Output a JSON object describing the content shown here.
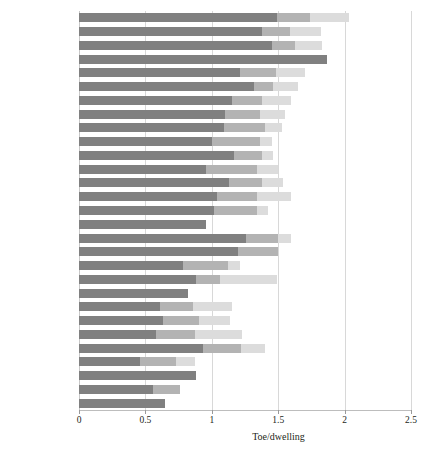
{
  "chart_data": {
    "type": "bar",
    "orientation": "horizontal",
    "stacked": true,
    "title": "",
    "subtitle": "",
    "xlabel": "Toe/dwelling",
    "ylabel": "",
    "xlim": [
      0,
      2.5
    ],
    "xticks": [
      0,
      0.5,
      1,
      1.5,
      2,
      2.5
    ],
    "xticklabels": [
      "0",
      "0.5",
      "1",
      "1.5",
      "2",
      "2.5"
    ],
    "grid": "vertical",
    "legend": "none",
    "categories": [
      "Finland",
      "Ireland",
      "Belgium",
      "Norway",
      "Austria",
      "Latvia",
      "Denmark",
      "Germany",
      "Sweden",
      "Estonia",
      "France",
      "United Kingdom",
      "Czech Republic",
      "Netherlands",
      "EU-27",
      "Slovenia",
      "Hungary",
      "Poland",
      "Greece",
      "Slovakia",
      "Italy",
      "Romania",
      "Croatia",
      "Cyprus",
      "Lithuania",
      "Spain",
      "Portugal",
      "Bulgaria",
      "Malta"
    ],
    "series": [
      {
        "name": "segment-1",
        "color": "#808080",
        "values": [
          1.49,
          1.38,
          1.45,
          1.87,
          1.21,
          1.32,
          1.15,
          1.1,
          1.09,
          1.0,
          1.17,
          0.96,
          1.13,
          1.04,
          1.02,
          0.96,
          1.26,
          1.2,
          0.78,
          0.88,
          0.82,
          0.61,
          0.63,
          0.58,
          0.93,
          0.46,
          0.88,
          0.56,
          0.65
        ]
      },
      {
        "name": "segment-2",
        "color": "#b3b3b3",
        "values": [
          0.25,
          0.21,
          0.18,
          0.0,
          0.27,
          0.14,
          0.23,
          0.26,
          0.31,
          0.36,
          0.21,
          0.38,
          0.25,
          0.3,
          0.32,
          0.0,
          0.24,
          0.3,
          0.34,
          0.18,
          0.0,
          0.25,
          0.27,
          0.29,
          0.29,
          0.27,
          0.0,
          0.2,
          0.0
        ]
      },
      {
        "name": "segment-3",
        "color": "#dcdcdc",
        "values": [
          0.29,
          0.23,
          0.2,
          0.0,
          0.22,
          0.19,
          0.22,
          0.19,
          0.13,
          0.09,
          0.08,
          0.16,
          0.16,
          0.26,
          0.08,
          0.0,
          0.1,
          0.0,
          0.09,
          0.43,
          0.0,
          0.29,
          0.24,
          0.36,
          0.18,
          0.14,
          0.0,
          0.0,
          0.0
        ]
      }
    ],
    "totals": [
      2.03,
      1.82,
      1.83,
      1.87,
      1.7,
      1.65,
      1.6,
      1.55,
      1.53,
      1.45,
      1.46,
      1.5,
      1.54,
      1.6,
      1.42,
      0.96,
      1.6,
      1.5,
      1.21,
      1.49,
      0.82,
      1.15,
      1.14,
      1.23,
      1.4,
      0.87,
      0.88,
      0.76,
      0.65
    ]
  },
  "axis": {
    "x_label": "Toe/dwelling",
    "ticks": [
      "0",
      "0.5",
      "1",
      "1.5",
      "2",
      "2.5"
    ]
  },
  "colors": {
    "segment_1": "#808080",
    "segment_2": "#b3b3b3",
    "segment_3": "#dcdcdc",
    "gridline": "#d8d8d8",
    "text": "#231f20",
    "background": "#ffffff"
  }
}
